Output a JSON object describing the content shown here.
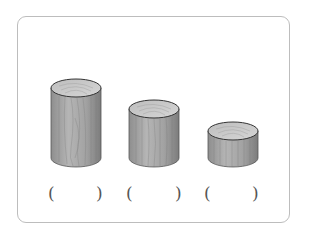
{
  "figure": {
    "cylinders": [
      {
        "label": "tall-cylinder",
        "answer_left": "(",
        "answer_blank": "",
        "answer_right": ")"
      },
      {
        "label": "medium-cylinder",
        "answer_left": "(",
        "answer_blank": "",
        "answer_right": ")"
      },
      {
        "label": "short-cylinder",
        "answer_left": "(",
        "answer_blank": "",
        "answer_right": ")"
      }
    ],
    "colors": {
      "border": "#bdbdbd",
      "wood_light": "#c9c9c9",
      "wood_dark": "#8a8a8a",
      "outline": "#4a4a4a"
    }
  }
}
